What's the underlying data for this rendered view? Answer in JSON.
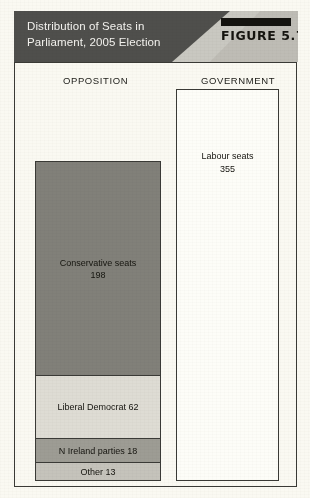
{
  "figure": {
    "title_line1": "Distribution of Seats in",
    "title_line2": "Parliament, 2005 Election",
    "figure_label": "FIGURE 5.7",
    "header_bg": "#4f4f4c",
    "header_text_color": "#f4f3ef",
    "page_bg": "#faf9f2",
    "border_color": "#3a3a36"
  },
  "columns": {
    "left_heading": "OPPOSITION",
    "right_heading": "GOVERNMENT"
  },
  "chart_data": {
    "type": "bar",
    "title": "Distribution of Seats in Parliament, 2005 Election",
    "subtitle": "",
    "xlabel": "",
    "ylabel": "Seats",
    "grid": false,
    "legend_position": "none",
    "categories": [
      "OPPOSITION",
      "GOVERNMENT"
    ],
    "total_seats": 646,
    "series": [
      {
        "name": "Opposition",
        "stacked": true,
        "segments": [
          {
            "label": "Conservative seats",
            "value": 198,
            "color": "#818079",
            "text": "Conservative seats",
            "value_text": "198"
          },
          {
            "label": "Liberal Democrat",
            "value": 62,
            "color": "#dedcd4",
            "text": "Liberal Democrat 62",
            "value_text": ""
          },
          {
            "label": "N Ireland parties",
            "value": 18,
            "color": "#9d9c94",
            "text": "N Ireland parties 18",
            "value_text": ""
          },
          {
            "label": "Other",
            "value": 13,
            "color": "#c5c3bb",
            "text": "Other 13",
            "value_text": ""
          }
        ]
      },
      {
        "name": "Government",
        "stacked": false,
        "segments": [
          {
            "label": "Labour seats",
            "value": 355,
            "color": "#fdfdf8",
            "text": "Labour seats",
            "value_text": "355"
          }
        ]
      }
    ]
  }
}
